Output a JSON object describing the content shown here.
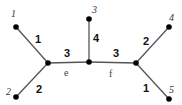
{
  "diagram": {
    "type": "weighted-tree",
    "leaf_labels": [
      "1",
      "2",
      "3",
      "4",
      "5"
    ],
    "internal_labels": [
      "e",
      "f"
    ],
    "edges": [
      {
        "from": "1",
        "to": "e",
        "weight": "1"
      },
      {
        "from": "2",
        "to": "e",
        "weight": "2"
      },
      {
        "from": "e",
        "to": "m",
        "weight": "3"
      },
      {
        "from": "3",
        "to": "m",
        "weight": "4"
      },
      {
        "from": "m",
        "to": "f",
        "weight": "3"
      },
      {
        "from": "4",
        "to": "f",
        "weight": "2"
      },
      {
        "from": "5",
        "to": "f",
        "weight": "1"
      }
    ]
  }
}
